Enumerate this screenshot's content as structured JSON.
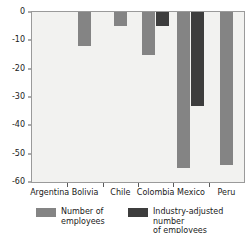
{
  "chart_data": {
    "type": "bar",
    "title": "",
    "xlabel": "",
    "ylabel": "",
    "ylim": [
      -60,
      0
    ],
    "yticks": [
      0,
      -10,
      -20,
      -30,
      -40,
      -50,
      -60
    ],
    "ytick_labels": [
      "0",
      "-10",
      "-20",
      "-30",
      "-40",
      "-50",
      "-60"
    ],
    "grid": false,
    "legend_position": "bottom",
    "categories": [
      "Argentina",
      "Bolivia",
      "Chile",
      "Colombia",
      "Mexico",
      "Peru"
    ],
    "series": [
      {
        "name": "Number of employees",
        "color": "#848484",
        "values": [
          0,
          -12,
          -5,
          -15,
          -55,
          -54
        ]
      },
      {
        "name": "Industry-adjusted number of employees",
        "color": "#3d3d3d",
        "values": [
          0,
          0,
          0,
          -5,
          -33,
          0
        ]
      }
    ]
  },
  "legend": {
    "items": [
      {
        "label": "Number of\nemployees",
        "swatch": "light"
      },
      {
        "label": "Industry-adjusted number\nof employees",
        "swatch": "dark"
      }
    ]
  },
  "colors": {
    "series_light": "#848484",
    "series_dark": "#3d3d3d",
    "plot_background": "#f2f2f0",
    "axis": "#9a9a9a"
  }
}
